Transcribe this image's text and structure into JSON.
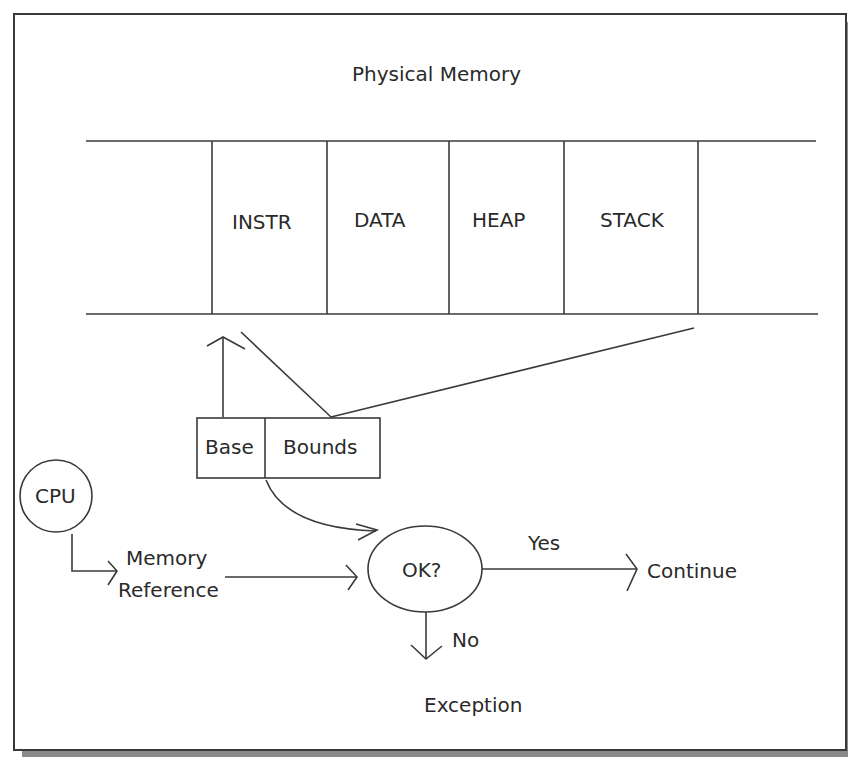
{
  "diagram": {
    "title": "Physical Memory",
    "segments": [
      {
        "label": "INSTR"
      },
      {
        "label": "DATA"
      },
      {
        "label": "HEAP"
      },
      {
        "label": "STACK"
      }
    ],
    "registers": {
      "base": "Base",
      "bounds": "Bounds"
    },
    "cpu": "CPU",
    "memory_reference": [
      "Memory",
      "Reference"
    ],
    "check": "OK?",
    "yes_label": "Yes",
    "no_label": "No",
    "continue_label": "Continue",
    "exception_label": "Exception",
    "colors": {
      "line": "#3a3a3a",
      "shadow": "#8a8a8a",
      "background": "#ffffff"
    }
  }
}
